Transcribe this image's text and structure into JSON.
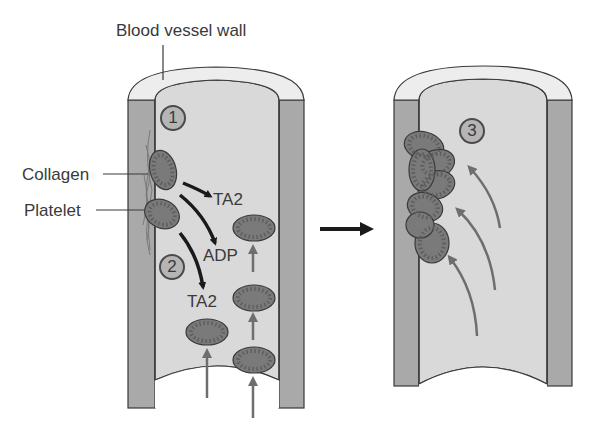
{
  "title_label": "Blood vessel wall",
  "labels": {
    "collagen": "Collagen",
    "platelet": "Platelet",
    "ta2_upper": "TA2",
    "adp": "ADP",
    "ta2_lower": "TA2"
  },
  "steps": [
    "1",
    "2",
    "3"
  ],
  "colors": {
    "wall_outer": "#a9a9a9",
    "wall_rim": "#ededed",
    "lumen": "#d9d9d9",
    "platelet_fill": "#7a7a7a",
    "platelet_stroke": "#3a3a3a",
    "arrow_black": "#1a1a1a",
    "arrow_gray": "#6e6e6e"
  },
  "panels": [
    {
      "name": "initial-adhesion",
      "step_numbers": [
        "1",
        "2"
      ]
    },
    {
      "name": "platelet-plug",
      "step_numbers": [
        "3"
      ]
    }
  ]
}
